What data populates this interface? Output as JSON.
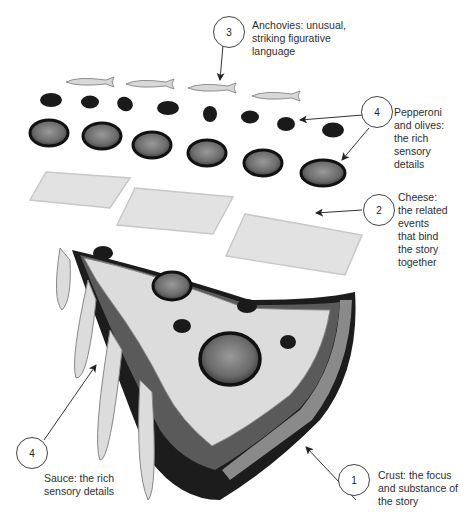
{
  "diagram": {
    "callouts": [
      {
        "id": "anchovies",
        "number": "3",
        "text": "Anchovies: unusual,\nstriking figurative\nlanguage"
      },
      {
        "id": "pepperoni",
        "number": "4",
        "text": "Pepperoni\nand olives:\nthe rich\nsensory\ndetails"
      },
      {
        "id": "cheese",
        "number": "2",
        "text": "Cheese:\nthe related\nevents\nthat bind\nthe story\ntogether"
      },
      {
        "id": "sauce",
        "number": "4",
        "text": "Sauce:  the rich\nsensory details"
      },
      {
        "id": "crust",
        "number": "1",
        "text": "Crust:  the focus\nand substance of\nthe story"
      }
    ],
    "layers": [
      "anchovies",
      "olives",
      "pepperoni",
      "cheese",
      "pizza-slice"
    ],
    "colors": {
      "line": "#444444",
      "cheese": "#e4e4e4",
      "olive": "#1a1a1a",
      "pepperoni": "#6a6a6a",
      "crust": "#1c1c1c"
    }
  }
}
